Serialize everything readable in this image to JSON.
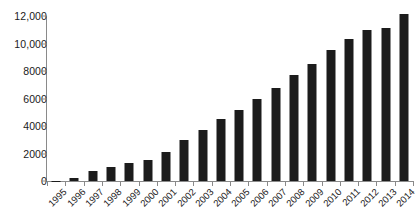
{
  "chart_data": {
    "type": "bar",
    "title": "",
    "subtitle": "",
    "xlabel": "",
    "ylabel": "",
    "categories": [
      "1995",
      "1996",
      "1997",
      "1998",
      "1999",
      "2000",
      "2001",
      "2002",
      "2003",
      "2004",
      "2005",
      "2006",
      "2007",
      "2008",
      "2009",
      "2010",
      "2011",
      "2012",
      "2013",
      "2014"
    ],
    "values": [
      30,
      250,
      700,
      1050,
      1300,
      1550,
      2100,
      2950,
      3700,
      4500,
      5200,
      6000,
      6800,
      7700,
      8500,
      9500,
      10300,
      11000,
      11150,
      12150
    ],
    "series": [
      {
        "name": "",
        "values": [
          30,
          250,
          700,
          1050,
          1300,
          1550,
          2100,
          2950,
          3700,
          4500,
          5200,
          6000,
          6800,
          7700,
          8500,
          9500,
          10300,
          11000,
          11150,
          12150
        ]
      }
    ],
    "ylim": [
      0,
      12000
    ],
    "yticks": [
      0,
      2000,
      4000,
      6000,
      8000,
      10000,
      12000
    ],
    "ytick_labels": [
      "0",
      "2000",
      "4000",
      "6000",
      "8000",
      "10,000",
      "12,000"
    ],
    "grid": false,
    "legend": false,
    "legend_position": "none",
    "bar_color": "#1c1c1c",
    "axis_color": "#8a8a8a",
    "background_color": "#ffffff",
    "xtick_rotation": -45,
    "annotations": []
  }
}
